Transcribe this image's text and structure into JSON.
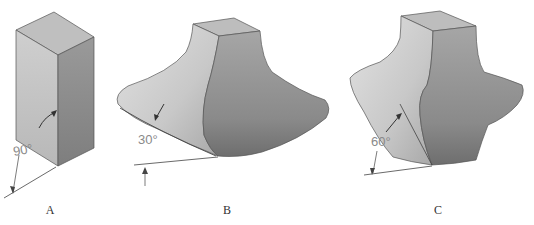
{
  "figures": [
    {
      "id": "A",
      "label": "A",
      "angle": "90°",
      "shape": "rectangular-prism"
    },
    {
      "id": "B",
      "label": "B",
      "angle": "30°",
      "shape": "flared-fillet-base-shallow"
    },
    {
      "id": "C",
      "label": "C",
      "angle": "60°",
      "shape": "flared-fillet-base-steep"
    }
  ],
  "colors": {
    "light_face": "#c4c4c4",
    "top_face": "#bdbdbd",
    "dark_face": "#8e8e8e",
    "edge": "#555555",
    "dimension_line": "#444444",
    "angle_text": "#8a8a8a"
  }
}
